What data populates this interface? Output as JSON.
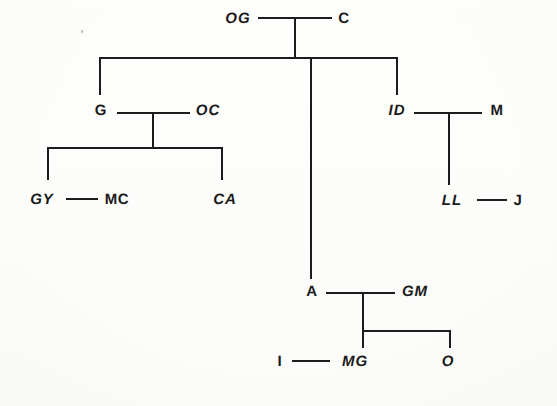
{
  "diagram": {
    "kind": "pedigree-tree",
    "background_color": "#fdfdfb",
    "ink_color": "#1c1c1c",
    "generations": 4,
    "nodes": {
      "og": {
        "label": "OG",
        "style": "italic"
      },
      "c": {
        "label": "C",
        "style": "upright"
      },
      "g": {
        "label": "G",
        "style": "upright"
      },
      "oc": {
        "label": "OC",
        "style": "italic"
      },
      "gy": {
        "label": "GY",
        "style": "italic"
      },
      "mc": {
        "label": "MC",
        "style": "upright"
      },
      "ca": {
        "label": "CA",
        "style": "italic"
      },
      "id": {
        "label": "ID",
        "style": "italic"
      },
      "m": {
        "label": "M",
        "style": "upright"
      },
      "ll": {
        "label": "LL",
        "style": "italic"
      },
      "j": {
        "label": "J",
        "style": "upright"
      },
      "a": {
        "label": "A",
        "style": "upright"
      },
      "gm": {
        "label": "GM",
        "style": "italic"
      },
      "i": {
        "label": "I",
        "style": "upright"
      },
      "mg": {
        "label": "MG",
        "style": "italic"
      },
      "o": {
        "label": "O",
        "style": "italic"
      }
    }
  }
}
